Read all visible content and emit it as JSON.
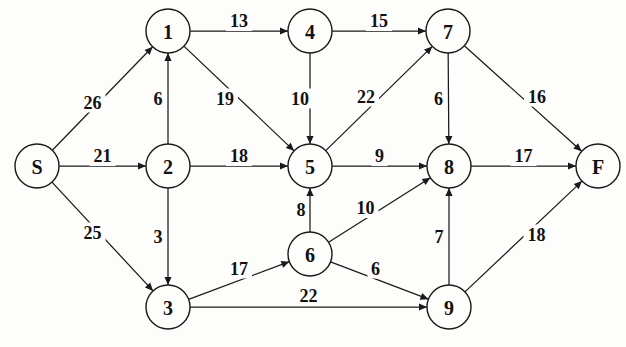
{
  "figure": {
    "width": 626,
    "height": 347,
    "background_color": "#fdfdfb",
    "stroke_color": "#1a1a1a",
    "text_color": "#111111"
  },
  "chart_data": {
    "type": "diagram",
    "diagram_kind": "weighted-directed-graph",
    "title": "",
    "directed": true,
    "node_radius": 22,
    "nodes": [
      {
        "id": "S",
        "label": "S",
        "x": 37,
        "y": 166
      },
      {
        "id": "1",
        "label": "1",
        "x": 168,
        "y": 31
      },
      {
        "id": "2",
        "label": "2",
        "x": 168,
        "y": 166
      },
      {
        "id": "3",
        "label": "3",
        "x": 168,
        "y": 307
      },
      {
        "id": "4",
        "label": "4",
        "x": 310,
        "y": 31
      },
      {
        "id": "5",
        "label": "5",
        "x": 310,
        "y": 166
      },
      {
        "id": "6",
        "label": "6",
        "x": 310,
        "y": 254
      },
      {
        "id": "7",
        "label": "7",
        "x": 448,
        "y": 31
      },
      {
        "id": "8",
        "label": "8",
        "x": 449,
        "y": 166
      },
      {
        "id": "9",
        "label": "9",
        "x": 449,
        "y": 307
      },
      {
        "id": "F",
        "label": "F",
        "x": 598,
        "y": 166
      }
    ],
    "edges": [
      {
        "from": "S",
        "to": "1",
        "weight": 26,
        "label_offset_x": -10,
        "label_offset_y": 4
      },
      {
        "from": "S",
        "to": "2",
        "weight": 21,
        "label_offset_x": 0,
        "label_offset_y": -10
      },
      {
        "from": "S",
        "to": "3",
        "weight": 25,
        "label_offset_x": -10,
        "label_offset_y": -4
      },
      {
        "from": "2",
        "to": "1",
        "weight": 6,
        "label_offset_x": -10,
        "label_offset_y": 0
      },
      {
        "from": "2",
        "to": "3",
        "weight": 3,
        "label_offset_x": -10,
        "label_offset_y": 0
      },
      {
        "from": "2",
        "to": "5",
        "weight": 18,
        "label_offset_x": 0,
        "label_offset_y": -10
      },
      {
        "from": "1",
        "to": "4",
        "weight": 13,
        "label_offset_x": 0,
        "label_offset_y": -10
      },
      {
        "from": "1",
        "to": "5",
        "weight": 19,
        "label_offset_x": -14,
        "label_offset_y": 0
      },
      {
        "from": "4",
        "to": "7",
        "weight": 15,
        "label_offset_x": 0,
        "label_offset_y": -10
      },
      {
        "from": "4",
        "to": "5",
        "weight": 10,
        "label_offset_x": -10,
        "label_offset_y": 0
      },
      {
        "from": "5",
        "to": "7",
        "weight": 22,
        "label_offset_x": -13,
        "label_offset_y": -2
      },
      {
        "from": "5",
        "to": "8",
        "weight": 9,
        "label_offset_x": 0,
        "label_offset_y": -10
      },
      {
        "from": "7",
        "to": "8",
        "weight": 6,
        "label_offset_x": -10,
        "label_offset_y": 0
      },
      {
        "from": "7",
        "to": "F",
        "weight": 16,
        "label_offset_x": 14,
        "label_offset_y": -2
      },
      {
        "from": "8",
        "to": "F",
        "weight": 17,
        "label_offset_x": 0,
        "label_offset_y": -10
      },
      {
        "from": "6",
        "to": "5",
        "weight": 8,
        "label_offset_x": -9,
        "label_offset_y": 0
      },
      {
        "from": "6",
        "to": "8",
        "weight": 10,
        "label_offset_x": -14,
        "label_offset_y": -2
      },
      {
        "from": "6",
        "to": "9",
        "weight": 6,
        "label_offset_x": -4,
        "label_offset_y": -12
      },
      {
        "from": "3",
        "to": "6",
        "weight": 17,
        "label_offset_x": 0,
        "label_offset_y": -12
      },
      {
        "from": "3",
        "to": "9",
        "weight": 22,
        "label_offset_x": 0,
        "label_offset_y": -11
      },
      {
        "from": "9",
        "to": "8",
        "weight": 7,
        "label_offset_x": -10,
        "label_offset_y": 0
      },
      {
        "from": "9",
        "to": "F",
        "weight": 18,
        "label_offset_x": 13,
        "label_offset_y": -2
      }
    ],
    "source_node": "S",
    "sink_node": "F",
    "node_count": 11,
    "edge_count": 22
  }
}
